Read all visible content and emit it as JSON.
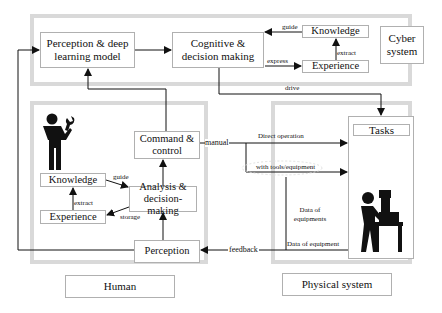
{
  "cyber_system": {
    "label": "Cyber system",
    "perception_model": "Perception & deep learning model",
    "cognitive": "Cognitive & decision making",
    "knowledge": "Knowledge",
    "experience": "Experience",
    "edges": {
      "guide": "guide",
      "express": "express",
      "extract": "extract",
      "drive": "drive"
    }
  },
  "human": {
    "label": "Human",
    "command": "Command & control",
    "knowledge": "Knowledge",
    "experience": "Experience",
    "analysis": "Analysis & decision-making",
    "perception": "Perception",
    "edges": {
      "guide": "guide",
      "extract": "extract",
      "storage": "storage",
      "manual": "manual",
      "feedback": "feedback"
    },
    "icon": "worker-with-wrench-icon"
  },
  "physical_system": {
    "label": "Physical system",
    "tasks": "Tasks",
    "edges": {
      "direct_operation": "Direct operation",
      "with_tools": "with tools/equipment",
      "data_of_equipments": "Data of equipments",
      "data_of_equipment": "Data of equipment"
    },
    "icon": "operator-at-machine-icon"
  }
}
